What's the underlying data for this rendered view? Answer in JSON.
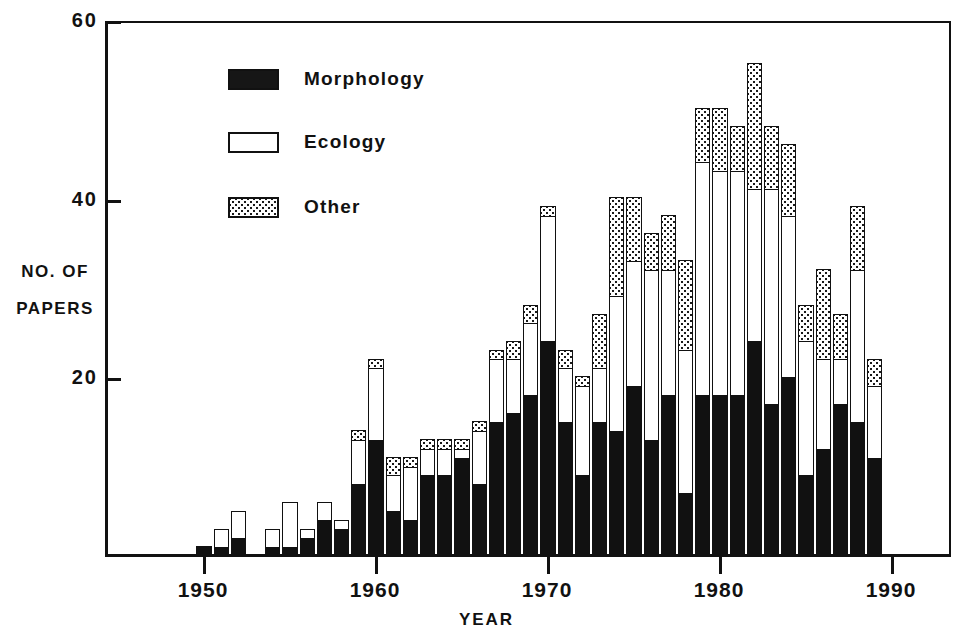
{
  "chart_data": {
    "type": "bar",
    "subtype": "stacked-vertical",
    "title": "",
    "xlabel": "YEAR",
    "ylabel": "NO. OF PAPERS",
    "ylabel_lines": [
      "NO. OF",
      "PAPERS"
    ],
    "ylim": [
      0,
      60
    ],
    "yticks": [
      0,
      20,
      40,
      60
    ],
    "ytick_labels": [
      "",
      "20",
      "40",
      "60"
    ],
    "xlim": [
      1949,
      1990
    ],
    "xticks": [
      1950,
      1960,
      1970,
      1980,
      1990
    ],
    "xtick_labels": [
      "1950",
      "1960",
      "1970",
      "1980",
      "1990"
    ],
    "grid": false,
    "legend_position": "upper-left-inside",
    "legend": [
      {
        "name": "Morphology",
        "pattern": "solid-black",
        "color": "#111111"
      },
      {
        "name": "Ecology",
        "pattern": "empty-white",
        "color": "#ffffff"
      },
      {
        "name": "Other",
        "pattern": "stippled-dots",
        "color": "#ffffff"
      }
    ],
    "categories": [
      1950,
      1951,
      1952,
      1953,
      1954,
      1955,
      1956,
      1957,
      1958,
      1959,
      1960,
      1961,
      1962,
      1963,
      1964,
      1965,
      1966,
      1967,
      1968,
      1969,
      1970,
      1971,
      1972,
      1973,
      1974,
      1975,
      1976,
      1977,
      1978,
      1979,
      1980,
      1981,
      1982,
      1983,
      1984,
      1985,
      1986,
      1987,
      1988,
      1989
    ],
    "series": [
      {
        "name": "Morphology",
        "values": [
          1,
          1,
          2,
          0,
          1,
          1,
          2,
          4,
          3,
          8,
          13,
          5,
          4,
          9,
          9,
          11,
          8,
          15,
          16,
          18,
          24,
          15,
          9,
          15,
          14,
          19,
          13,
          18,
          7,
          18,
          18,
          18,
          24,
          17,
          20,
          9,
          12,
          17,
          15,
          11
        ],
        "total": 456
      },
      {
        "name": "Ecology",
        "values": [
          0,
          2,
          3,
          0,
          2,
          5,
          1,
          2,
          1,
          5,
          8,
          4,
          6,
          3,
          3,
          1,
          6,
          7,
          6,
          8,
          14,
          6,
          10,
          6,
          15,
          14,
          19,
          14,
          16,
          26,
          25,
          25,
          17,
          24,
          18,
          15,
          10,
          5,
          17,
          8
        ],
        "total": 398
      },
      {
        "name": "Other",
        "values": [
          0,
          0,
          0,
          0,
          0,
          0,
          0,
          0,
          0,
          1,
          1,
          2,
          1,
          1,
          1,
          1,
          1,
          1,
          2,
          2,
          1,
          2,
          1,
          6,
          11,
          7,
          4,
          6,
          10,
          6,
          7,
          5,
          14,
          7,
          8,
          4,
          10,
          5,
          7,
          3
        ],
        "total": 161
      }
    ],
    "totals": [
      1,
      3,
      5,
      0,
      3,
      6,
      3,
      6,
      4,
      14,
      22,
      11,
      11,
      13,
      13,
      13,
      15,
      23,
      24,
      28,
      39,
      23,
      20,
      27,
      40,
      40,
      36,
      38,
      33,
      50,
      50,
      48,
      55,
      48,
      46,
      28,
      32,
      27,
      39,
      22
    ],
    "axis_color": "#111111"
  },
  "axes": {
    "y_ticks": [
      {
        "label": "60",
        "value": 60
      },
      {
        "label": "40",
        "value": 40
      },
      {
        "label": "20",
        "value": 20
      }
    ],
    "x_ticks": [
      {
        "label": "1950",
        "value": 1950
      },
      {
        "label": "1960",
        "value": 1960
      },
      {
        "label": "1970",
        "value": 1970
      },
      {
        "label": "1980",
        "value": 1980
      },
      {
        "label": "1990",
        "value": 1990
      }
    ],
    "y_title_lines": [
      "NO. OF",
      "PAPERS"
    ],
    "x_title": "YEAR"
  },
  "legend": {
    "items": [
      {
        "label": "Morphology"
      },
      {
        "label": "Ecology"
      },
      {
        "label": "Other"
      }
    ]
  }
}
